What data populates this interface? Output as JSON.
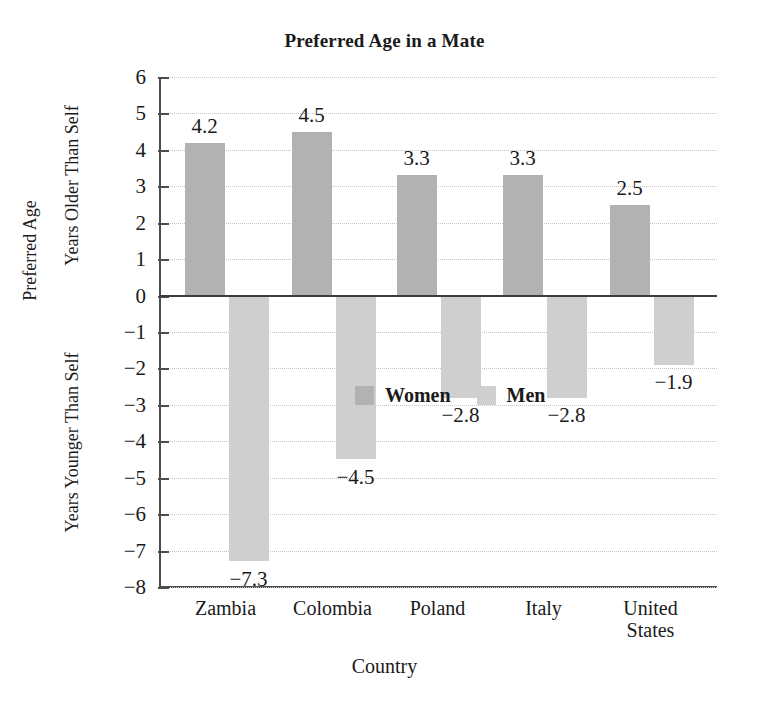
{
  "chart_data": {
    "type": "bar",
    "title": "Preferred Age in a Mate",
    "xlabel": "Country",
    "ylabel": "Preferred Age",
    "ylabel_upper": "Years Older Than Self",
    "ylabel_lower": "Years Younger Than Self",
    "categories": [
      "Zambia",
      "Colombia",
      "Poland",
      "Italy",
      "United\nStates"
    ],
    "series": [
      {
        "name": "Women",
        "color": "#b2b2b2",
        "values": [
          4.2,
          4.5,
          3.3,
          3.3,
          2.5
        ],
        "labels": [
          "4.2",
          "4.5",
          "3.3",
          "3.3",
          "2.5"
        ]
      },
      {
        "name": "Men",
        "color": "#cfcfcf",
        "values": [
          -7.3,
          -4.5,
          -2.8,
          -2.8,
          -1.9
        ],
        "labels": [
          "−7.3",
          "−4.5",
          "−2.8",
          "−2.8",
          "−1.9"
        ]
      }
    ],
    "ylim": [
      -8,
      6
    ],
    "yticks": [
      6,
      5,
      4,
      3,
      2,
      1,
      0,
      -1,
      -2,
      -3,
      -4,
      -5,
      -6,
      -7,
      -8
    ],
    "ytick_labels": [
      "6",
      "5",
      "4",
      "3",
      "2",
      "1",
      "0",
      "−1",
      "−2",
      "−3",
      "−4",
      "−5",
      "−6",
      "−7",
      "−8"
    ],
    "grid": true,
    "legend_position": "inside-center-lower",
    "legend_entries": [
      "Women",
      "Men"
    ]
  }
}
